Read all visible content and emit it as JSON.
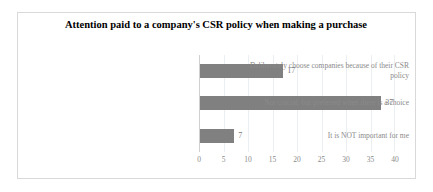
{
  "chart_data": {
    "type": "bar",
    "orientation": "horizontal",
    "title": "Attention paid to a company's CSR policy when making a purchase",
    "xlabel": "",
    "ylabel": "",
    "xlim": [
      0,
      40
    ],
    "xticks": [
      "0",
      "5",
      "10",
      "15",
      "20",
      "25",
      "30",
      "35",
      "40"
    ],
    "grid": true,
    "legend": "none",
    "bar_color": "#808080",
    "categories": [
      "Deliberately choose companies because of their CSR policy",
      "Not crucial, but preferred when there is a choice",
      "It is NOT important for me"
    ],
    "values": [
      17,
      37,
      7
    ],
    "data_labels": [
      "17",
      "37",
      "7"
    ]
  }
}
